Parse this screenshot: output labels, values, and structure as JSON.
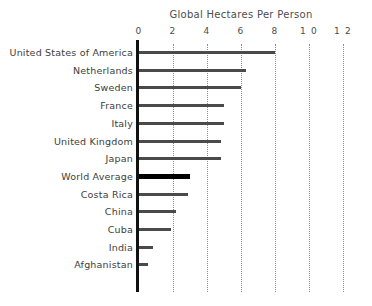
{
  "chart_data": {
    "type": "bar",
    "orientation": "horizontal",
    "title": "Global Hectares Per Person",
    "xlabel": "",
    "ylabel": "",
    "xlim": [
      0,
      12
    ],
    "ylim": null,
    "grid": "vertical-dotted",
    "legend": null,
    "legend_position": "none",
    "tick_labels": [
      "0",
      "2",
      "4",
      "6",
      "8",
      "1 0",
      "1 2"
    ],
    "ticks": [
      0,
      2,
      4,
      6,
      8,
      10,
      12
    ],
    "categories": [
      "United States of America",
      "Netherlands",
      "Sweden",
      "France",
      "Italy",
      "United Kingdom",
      "Japan",
      "World Average",
      "Costa Rica",
      "China",
      "Cuba",
      "India",
      "Afghanistan"
    ],
    "values": [
      8.0,
      6.3,
      6.0,
      5.0,
      5.0,
      4.8,
      4.8,
      3.0,
      2.9,
      2.2,
      1.9,
      0.8,
      0.5
    ],
    "highlight_category": "World Average",
    "colors": {
      "bar": "#4a4a4a",
      "bar_highlight": "#000000",
      "axis": "#111111",
      "gridline": "#8c8c8c",
      "text": "#3d3d3d",
      "title": "#4d4d4d",
      "background": "#ffffff"
    }
  }
}
